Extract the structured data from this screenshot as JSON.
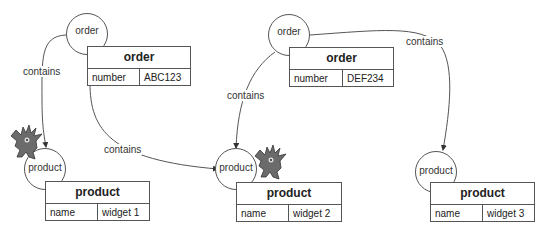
{
  "diagram": {
    "nodes": [
      {
        "id": "order1",
        "circle_label": "order",
        "table_title": "order",
        "field": "number",
        "value": "ABC123"
      },
      {
        "id": "order2",
        "circle_label": "order",
        "table_title": "order",
        "field": "number",
        "value": "DEF234"
      },
      {
        "id": "product1",
        "circle_label": "product",
        "table_title": "product",
        "field": "name",
        "value": "widget 1"
      },
      {
        "id": "product2",
        "circle_label": "product",
        "table_title": "product",
        "field": "name",
        "value": "widget 2"
      },
      {
        "id": "product3",
        "circle_label": "product",
        "table_title": "product",
        "field": "name",
        "value": "widget 3"
      }
    ],
    "edges": [
      {
        "from": "order1",
        "to": "product1",
        "label": "contains"
      },
      {
        "from": "order1",
        "to": "product2",
        "label": "contains"
      },
      {
        "from": "order2",
        "to": "product2",
        "label": "contains"
      },
      {
        "from": "order2",
        "to": "product3",
        "label": "contains"
      }
    ],
    "icons": [
      "monster-icon",
      "monster-icon"
    ],
    "colors": {
      "stroke": "#555555",
      "monster": "#6b6b6b"
    }
  }
}
